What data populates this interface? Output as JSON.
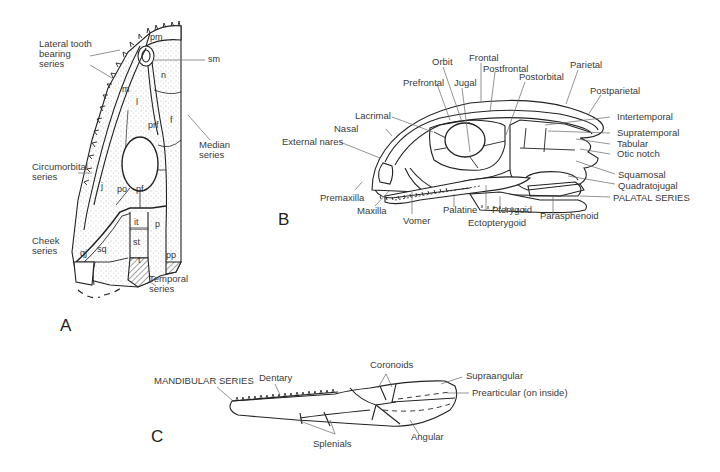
{
  "figure": {
    "panels": [
      {
        "id": "A",
        "label": "A",
        "description": "Dorsal view of skull, half"
      },
      {
        "id": "B",
        "label": "B",
        "description": "Lateral view of skull"
      },
      {
        "id": "C",
        "label": "C",
        "description": "Lateral view of lower jaw"
      }
    ],
    "panel_a": {
      "series_labels": {
        "lateral": "Lateral tooth bearing series",
        "lateral_lines": [
          "Lateral tooth",
          "bearing",
          "series"
        ],
        "median_lines": [
          "Median",
          "series"
        ],
        "circumorbital_lines": [
          "Circumorbital",
          "series"
        ],
        "cheek_lines": [
          "Cheek",
          "series"
        ],
        "temporal_lines": [
          "Temporal",
          "series"
        ]
      },
      "bone_abbrevs": {
        "pm": "pm",
        "sm": "sm",
        "n": "n",
        "m": "m",
        "l": "l",
        "prf": "prf",
        "f": "f",
        "j": "j",
        "po": "po",
        "pf": "pf",
        "it": "it",
        "p": "p",
        "st": "st",
        "t": "t",
        "pp": "pp",
        "qj": "qj",
        "sq": "sq"
      }
    },
    "panel_b": {
      "labels": {
        "orbit": "Orbit",
        "frontal": "Frontal",
        "postfrontal": "Postfrontal",
        "prefrontal": "Prefrontal",
        "jugal": "Jugal",
        "postorbital": "Postorbital",
        "parietal": "Parietal",
        "postparietal": "Postparietal",
        "lacrimal": "Lacrimal",
        "nasal": "Nasal",
        "external_nares": "External nares",
        "intertemporal": "Intertemporal",
        "supratemporal": "Supratemporal",
        "tabular": "Tabular",
        "otic_notch": "Otic notch",
        "squamosal": "Squamosal",
        "quadratojugal": "Quadratojugal",
        "palatal_series": "PALATAL SERIES",
        "premaxilla": "Premaxilla",
        "maxilla": "Maxilla",
        "vomer": "Vomer",
        "palatine": "Palatine",
        "pterygoid": "Pterygoid",
        "ectopterygoid": "Ectopterygoid",
        "parasphenoid": "Parasphenoid"
      }
    },
    "panel_c": {
      "labels": {
        "mandibular_series": "MANDIBULAR SERIES",
        "dentary": "Dentary",
        "coronoids": "Coronoids",
        "supraangular": "Supraangular",
        "prearticular": "Prearticular (on inside)",
        "angular": "Angular",
        "splenials": "Splenials"
      }
    }
  }
}
